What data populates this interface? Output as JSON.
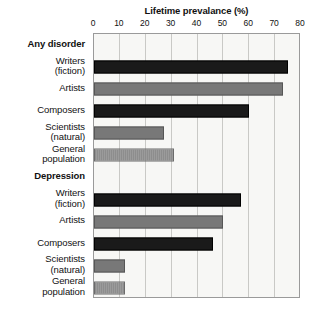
{
  "chart_data": {
    "type": "bar",
    "orientation": "horizontal",
    "title": "Lifetime prevalance (%)",
    "xlabel": "",
    "ylabel": "",
    "xlim": [
      0,
      80
    ],
    "xticks": [
      0,
      10,
      20,
      30,
      40,
      50,
      60,
      70,
      80
    ],
    "tick_labels": [
      "0",
      "10",
      "20",
      "30",
      "40",
      "50",
      "60",
      "70",
      "80"
    ],
    "grid": true,
    "legend": "none",
    "groups": [
      {
        "name": "Any disorder",
        "categories": [
          "Writers (fiction)",
          "Artists",
          "Composers",
          "Scientists (natural)",
          "General population"
        ],
        "values": [
          75,
          73,
          60,
          27,
          31
        ]
      },
      {
        "name": "Depression",
        "categories": [
          "Writers (fiction)",
          "Artists",
          "Composers",
          "Scientists (natural)",
          "General population"
        ],
        "values": [
          57,
          50,
          46,
          12,
          12
        ]
      }
    ],
    "categories": [
      "Writers (fiction)",
      "Artists",
      "Composers",
      "Scientists (natural)",
      "General population"
    ],
    "series": [
      {
        "name": "Any disorder",
        "values": [
          75,
          73,
          60,
          27,
          31
        ]
      },
      {
        "name": "Depression",
        "values": [
          57,
          50,
          46,
          12,
          12
        ]
      }
    ],
    "bar_colors": {
      "writers": "#1a1a1a",
      "artists": "#787878",
      "composers": "#1a1a1a",
      "scientists": "#787878",
      "general_population": "#919191"
    }
  },
  "rows": [
    {
      "kind": "group",
      "line1": "Any disorder",
      "line2": "",
      "value": null,
      "style": ""
    },
    {
      "kind": "bar",
      "line1": "Writers",
      "line2": "(fiction)",
      "value": 75,
      "style": "dark"
    },
    {
      "kind": "bar",
      "line1": "Artists",
      "line2": "",
      "value": 73,
      "style": "mid"
    },
    {
      "kind": "bar",
      "line1": "Composers",
      "line2": "",
      "value": 60,
      "style": "dark"
    },
    {
      "kind": "bar",
      "line1": "Scientists",
      "line2": "(natural)",
      "value": 27,
      "style": "mid"
    },
    {
      "kind": "bar",
      "line1": "General",
      "line2": "population",
      "value": 31,
      "style": "light"
    },
    {
      "kind": "group",
      "line1": "Depression",
      "line2": "",
      "value": null,
      "style": ""
    },
    {
      "kind": "bar",
      "line1": "Writers",
      "line2": "(fiction)",
      "value": 57,
      "style": "dark"
    },
    {
      "kind": "bar",
      "line1": "Artists",
      "line2": "",
      "value": 50,
      "style": "mid"
    },
    {
      "kind": "bar",
      "line1": "Composers",
      "line2": "",
      "value": 46,
      "style": "dark"
    },
    {
      "kind": "bar",
      "line1": "Scientists",
      "line2": "(natural)",
      "value": 12,
      "style": "mid"
    },
    {
      "kind": "bar",
      "line1": "General",
      "line2": "population",
      "value": 12,
      "style": "light"
    }
  ]
}
